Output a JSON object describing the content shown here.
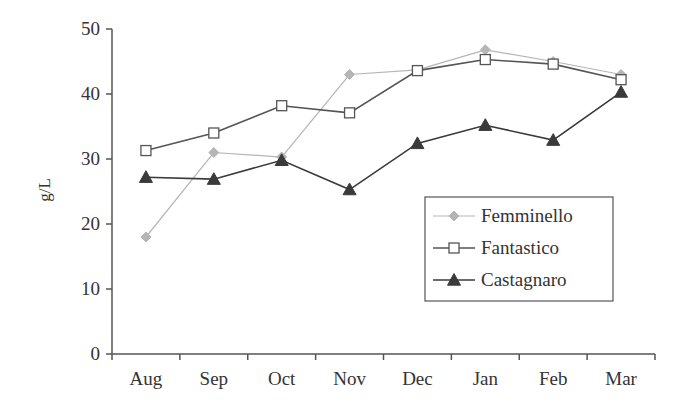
{
  "chart_data": {
    "type": "line",
    "title": "",
    "xlabel": "",
    "ylabel": "g/L",
    "ylim": [
      0,
      50
    ],
    "yticks": [
      0,
      10,
      20,
      30,
      40,
      50
    ],
    "grid": false,
    "legend_position": "inside lower right",
    "categories": [
      "Aug",
      "Sep",
      "Oct",
      "Nov",
      "Dec",
      "Jan",
      "Feb",
      "Mar"
    ],
    "series": [
      {
        "name": "Femminello",
        "marker": "diamond",
        "color": "#b5b5b5",
        "values": [
          18,
          31,
          30.3,
          43,
          43.7,
          46.8,
          45,
          43
        ]
      },
      {
        "name": "Fantastico",
        "marker": "square-open",
        "color": "#555555",
        "values": [
          31.3,
          34,
          38.2,
          37.1,
          43.6,
          45.3,
          44.6,
          42.2
        ]
      },
      {
        "name": "Castagnaro",
        "marker": "triangle",
        "color": "#3a3a3a",
        "values": [
          27.2,
          26.9,
          29.8,
          25.3,
          32.4,
          35.2,
          32.9,
          40.3
        ]
      }
    ]
  },
  "axis": {
    "y_title": "g/L"
  },
  "legend": {
    "items": [
      "Femminello",
      "Fantastico",
      "Castagnaro"
    ]
  }
}
